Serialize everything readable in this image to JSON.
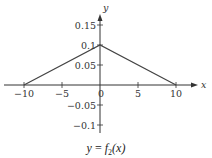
{
  "chart_data": {
    "type": "line",
    "title": "",
    "caption": "y = f2(x)",
    "caption_parts": {
      "lhs": "y",
      "eq": " = ",
      "func": "f",
      "sub": "2",
      "arg": "(x)"
    },
    "xlabel": "x",
    "ylabel": "y",
    "xlim": [
      -10,
      10
    ],
    "ylim": [
      -0.1,
      0.15
    ],
    "x_ticks": [
      -10,
      -5,
      0,
      5,
      10
    ],
    "x_tick_labels": [
      "−10",
      "−5",
      "0",
      "5",
      "10"
    ],
    "y_ticks": [
      -0.1,
      -0.05,
      0.05,
      0.1,
      0.15
    ],
    "y_tick_labels": [
      "−0.1",
      "−0.05",
      "0.05",
      "0.1",
      "0.15"
    ],
    "grid": false,
    "legend": null,
    "series": [
      {
        "name": "f2(x)",
        "x": [
          -10,
          0,
          10
        ],
        "y": [
          0,
          0.1,
          0
        ]
      }
    ],
    "colors": {
      "line": "#444444",
      "axis": "#333333",
      "text": "#333333"
    }
  }
}
